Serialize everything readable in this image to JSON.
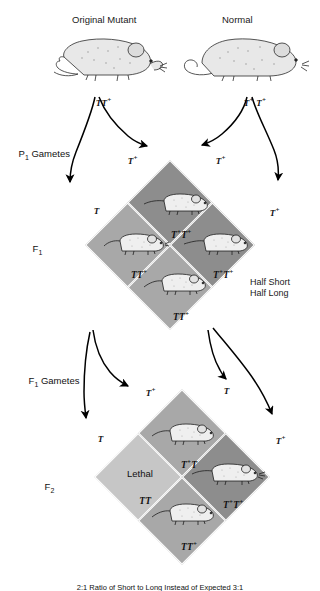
{
  "parents": {
    "left": {
      "label": "Original Mutant",
      "genotype_allele1": "T",
      "genotype_allele2": "T",
      "genotype_sup": "+",
      "genotype_text": "TT"
    },
    "right": {
      "label": "Normal",
      "genotype_text": "T",
      "genotype_text2": "T"
    }
  },
  "stages": {
    "p1_gametes": "P",
    "p1_gametes_sub": "1",
    "p1_gametes_rest": " Gametes",
    "f1": "F",
    "f1_sub": "1",
    "f1_gametes": "F",
    "f1_gametes_sub": "1",
    "f1_gametes_rest": " Gametes",
    "f2": "F",
    "f2_sub": "2"
  },
  "f1_square": {
    "gamete_top_left": "T",
    "gamete_top_left_sup": "+",
    "gamete_top_right": "T",
    "gamete_top_right_sup": "+",
    "gamete_left": "T",
    "gamete_right": "T",
    "gamete_right_sup": "+",
    "cells": [
      {
        "position": "top",
        "genotype": "T",
        "sup1": "+",
        "genotype2": "T",
        "sup2": "+",
        "shade": "dark",
        "has_mouse": true,
        "mouse_type": "long"
      },
      {
        "position": "left",
        "genotype": "T",
        "sup1": "",
        "genotype2": "T",
        "sup2": "+",
        "shade": "medium",
        "has_mouse": true,
        "mouse_type": "short"
      },
      {
        "position": "right",
        "genotype": "T",
        "sup1": "+",
        "genotype2": "T",
        "sup2": "+",
        "shade": "dark",
        "has_mouse": true,
        "mouse_type": "long"
      },
      {
        "position": "bottom",
        "genotype": "T",
        "sup1": "",
        "genotype2": "T",
        "sup2": "+",
        "shade": "medium",
        "has_mouse": true,
        "mouse_type": "short"
      }
    ],
    "annotation_line1": "Half Short",
    "annotation_line2": "Half Long"
  },
  "f2_square": {
    "gamete_top_left": "T",
    "gamete_top_left_sup": "+",
    "gamete_top_right": "T",
    "gamete_left": "T",
    "gamete_right": "T",
    "gamete_right_sup": "+",
    "cells": [
      {
        "position": "top",
        "genotype": "T",
        "sup1": "+",
        "genotype2": "T",
        "sup2": "",
        "shade": "medium",
        "has_mouse": true,
        "mouse_type": "short",
        "lethal_label": ""
      },
      {
        "position": "left",
        "genotype": "T",
        "sup1": "",
        "genotype2": "T",
        "sup2": "",
        "shade": "light",
        "has_mouse": false,
        "mouse_type": "",
        "lethal_label": "Lethal"
      },
      {
        "position": "right",
        "genotype": "T",
        "sup1": "+",
        "genotype2": "T",
        "sup2": "+",
        "shade": "dark",
        "has_mouse": true,
        "mouse_type": "long",
        "lethal_label": ""
      },
      {
        "position": "bottom",
        "genotype": "T",
        "sup1": "",
        "genotype2": "T",
        "sup2": "+",
        "shade": "medium",
        "has_mouse": true,
        "mouse_type": "short",
        "lethal_label": ""
      }
    ]
  },
  "caption": "2:1 Ratio of Short to Long Instead of Expected 3:1",
  "colors": {
    "shade_light": "#c6c6c6",
    "shade_medium": "#a8a8a8",
    "shade_dark": "#8d8d8d",
    "text": "#111111",
    "background": "#ffffff"
  }
}
